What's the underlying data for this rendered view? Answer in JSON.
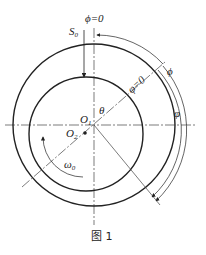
{
  "figure": {
    "caption": "图 1",
    "labels": {
      "phi_zero": "ϕ=0",
      "s0": "S",
      "s0_sub": "0",
      "varphi_zero": "φ=0",
      "phi": "ϕ",
      "varphi": "φ",
      "theta": "θ",
      "o1": "O",
      "o1_sub": "1",
      "o2": "O",
      "o2_sub": "2",
      "omega0": "ω",
      "omega0_sub": "0"
    },
    "colors": {
      "line": "#222222",
      "background": "#ffffff"
    }
  }
}
